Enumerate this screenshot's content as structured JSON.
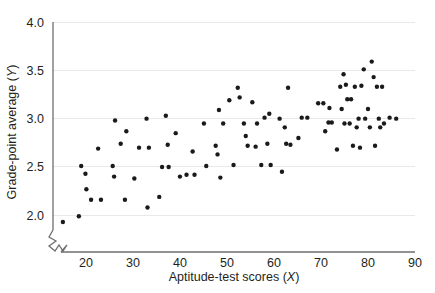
{
  "chart_data": {
    "type": "scatter",
    "title": "",
    "xlabel": "Aptitude-test scores (X)",
    "ylabel": "Grade-point average (Y)",
    "xlabel_text": "Aptitude-test scores (",
    "xlabel_var": "X",
    "xlabel_tail": ")",
    "ylabel_text": "Grade-point average (",
    "ylabel_var": "Y",
    "ylabel_tail": ")",
    "xlim": [
      13,
      90
    ],
    "ylim": [
      1.62,
      4.0
    ],
    "xticks": [
      20,
      30,
      40,
      50,
      60,
      70,
      80,
      90
    ],
    "xtick_labels": [
      "20",
      "30",
      "40",
      "50",
      "60",
      "70",
      "80",
      "90"
    ],
    "yticks": [
      2.0,
      2.5,
      3.0,
      3.5,
      4.0
    ],
    "ytick_labels": [
      "2.0",
      "2.5",
      "3.0",
      "3.5",
      "4.0"
    ],
    "grid": "horizontal",
    "grid_color": "#e9e9ea",
    "axis_color": "#6d6e71",
    "point_color": "#1a1a1a",
    "point_radius": 2.2,
    "axis_break": true,
    "legend": null,
    "n_points": 95,
    "x": [
      15.1,
      18.5,
      19.0,
      19.9,
      20.1,
      21.1,
      22.6,
      23.2,
      25.7,
      26.0,
      26.2,
      27.4,
      28.3,
      28.6,
      30.3,
      31.3,
      32.9,
      33.1,
      33.4,
      35.6,
      36.2,
      37.0,
      37.4,
      37.6,
      39.1,
      40.0,
      41.4,
      42.7,
      43.1,
      45.1,
      45.6,
      47.6,
      48.0,
      48.3,
      48.6,
      49.2,
      50.5,
      51.4,
      52.3,
      52.7,
      53.6,
      54.0,
      54.4,
      55.4,
      56.1,
      56.4,
      57.3,
      58.0,
      58.6,
      59.0,
      59.3,
      61.2,
      61.7,
      62.3,
      62.6,
      63.0,
      63.5,
      65.2,
      65.9,
      67.1,
      69.4,
      70.5,
      70.9,
      71.6,
      71.8,
      72.3,
      73.4,
      74.1,
      74.4,
      74.8,
      75.0,
      75.3,
      75.6,
      76.1,
      76.4,
      76.8,
      77.2,
      77.6,
      78.0,
      78.3,
      78.6,
      79.1,
      79.4,
      80.0,
      80.4,
      80.8,
      81.2,
      81.5,
      81.9,
      82.3,
      82.6,
      83.0,
      83.4,
      84.6,
      86.0
    ],
    "y": [
      1.93,
      1.99,
      2.51,
      2.43,
      2.27,
      2.16,
      2.69,
      2.16,
      2.51,
      2.4,
      2.98,
      2.74,
      2.16,
      2.87,
      2.38,
      2.7,
      3.0,
      2.08,
      2.7,
      2.19,
      2.5,
      3.03,
      2.73,
      2.5,
      2.85,
      2.4,
      2.42,
      2.66,
      2.42,
      2.95,
      2.51,
      2.72,
      2.63,
      3.09,
      2.39,
      2.95,
      3.19,
      2.52,
      3.32,
      3.22,
      2.95,
      2.82,
      2.72,
      3.17,
      2.71,
      2.95,
      2.52,
      3.01,
      2.74,
      3.05,
      2.52,
      3.0,
      2.45,
      2.91,
      2.74,
      3.32,
      2.73,
      2.8,
      3.01,
      3.01,
      3.16,
      3.16,
      2.87,
      2.96,
      3.11,
      2.96,
      2.68,
      3.33,
      3.1,
      3.46,
      2.95,
      3.35,
      3.2,
      2.95,
      3.2,
      2.72,
      3.33,
      2.91,
      3.0,
      2.7,
      3.34,
      3.51,
      3.0,
      3.1,
      2.91,
      3.59,
      3.43,
      2.72,
      3.33,
      3.0,
      2.91,
      3.33,
      2.95,
      3.01,
      3.0
    ]
  }
}
